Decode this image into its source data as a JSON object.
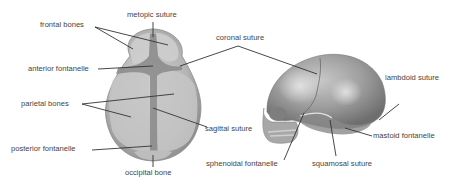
{
  "diagram": {
    "views": [
      {
        "name": "top-view",
        "description": "infant skull seen from above"
      },
      {
        "name": "side-view",
        "description": "infant skull seen from the side"
      }
    ],
    "labels": {
      "frontal_bones": "frontal bones",
      "metopic_suture": "metopic suture",
      "coronal_suture": "coronal suture",
      "anterior_fontanelle": "anterior fontanelle",
      "parietal_bones": "parietal bones",
      "sagittal_suture": "sagittal suture",
      "posterior_fontanelle": "posterior fontanelle",
      "occipital_bone": "occipital bone",
      "lambdoid_suture": "lambdoid suture",
      "mastoid_fontanelle": "mastoid fontanelle",
      "sphenoidal_fontanelle": "sphenoidal fontanelle",
      "squamosal_suture": "squamosal suture"
    },
    "colors": {
      "bone_light": "#c9c9c9",
      "bone_mid": "#a9a9a9",
      "bone_dark": "#7f7f7f",
      "fontanelle": "#8a8a8a",
      "leader_line": "#333333",
      "label_text": "#444444"
    }
  }
}
